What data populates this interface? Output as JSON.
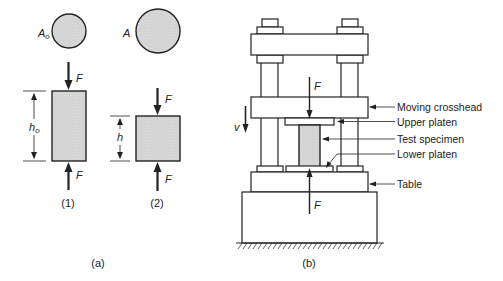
{
  "figure": {
    "part_a": {
      "caption": "(a)",
      "state1": {
        "label": "(1)",
        "area_label": "A",
        "area_sub": "o",
        "height_label": "h",
        "height_sub": "o",
        "force_top": "F",
        "force_bottom": "F"
      },
      "state2": {
        "label": "(2)",
        "area_label": "A",
        "height_label": "h",
        "force_top": "F",
        "force_bottom": "F"
      }
    },
    "part_b": {
      "caption": "(b)",
      "velocity_label": "v",
      "force_top": "F",
      "force_bottom": "F",
      "callouts": [
        {
          "id": "moving-crosshead",
          "label": "Moving crosshead"
        },
        {
          "id": "upper-platen",
          "label": "Upper platen"
        },
        {
          "id": "test-specimen",
          "label": "Test specimen"
        },
        {
          "id": "lower-platen",
          "label": "Lower platen"
        },
        {
          "id": "table",
          "label": "Table"
        }
      ]
    }
  },
  "colors": {
    "ink": "#222222",
    "specimen_fill": "#d9d9d9",
    "background": "#ffffff"
  }
}
